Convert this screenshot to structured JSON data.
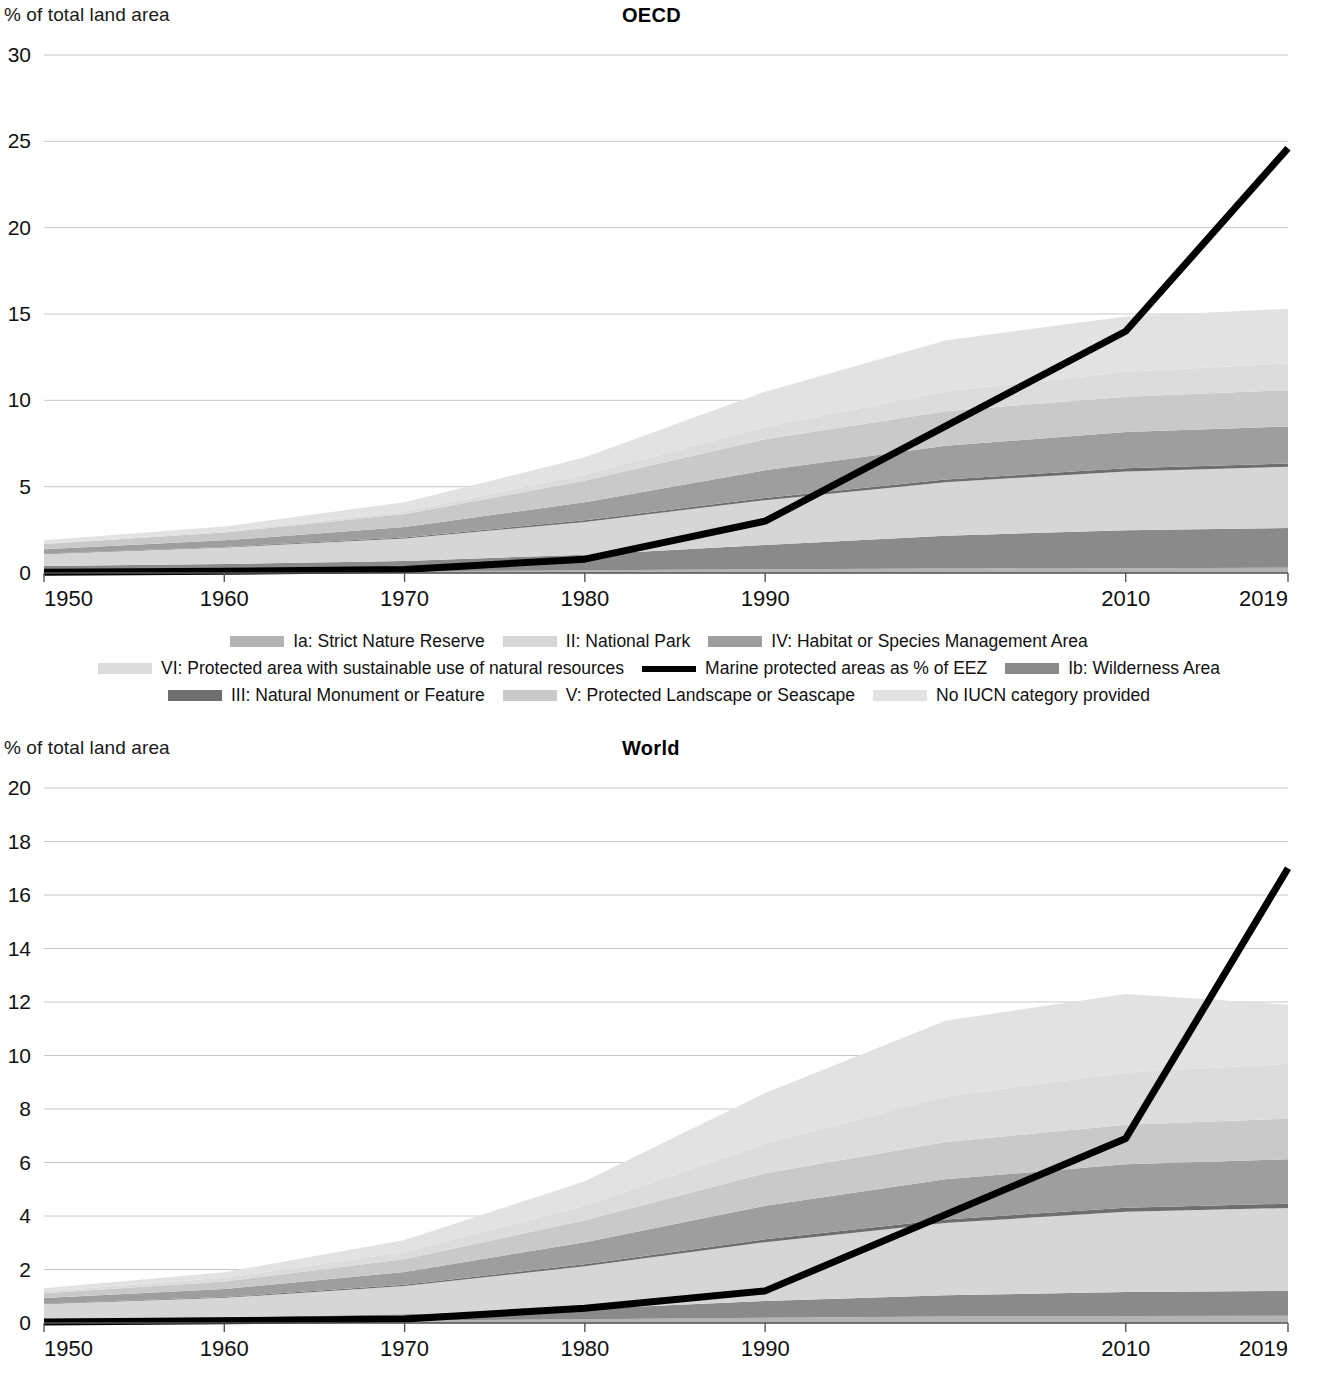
{
  "panels": [
    {
      "id": "oecd",
      "title": "OECD",
      "y_axis_caption": "% of total land area",
      "y_ticks": [
        0,
        5,
        10,
        15,
        20,
        25,
        30
      ],
      "x_ticks": [
        "1950",
        "1960",
        "1970",
        "1980",
        "1990",
        "2010",
        "2019"
      ]
    },
    {
      "id": "world",
      "title": "World",
      "y_axis_caption": "% of total land area",
      "y_ticks": [
        0,
        2,
        4,
        6,
        8,
        10,
        12,
        14,
        16,
        18,
        20
      ],
      "x_ticks": [
        "1950",
        "1960",
        "1970",
        "1980",
        "1990",
        "2010",
        "2019"
      ]
    }
  ],
  "legend": {
    "rows": [
      [
        {
          "label": "Ia: Strict Nature Reserve",
          "swatch": "#b3b3b3",
          "type": "area"
        },
        {
          "label": "II: National Park",
          "swatch": "#d6d6d6",
          "type": "area"
        },
        {
          "label": "IV: Habitat or Species Management Area",
          "swatch": "#9e9e9e",
          "type": "area"
        }
      ],
      [
        {
          "label": "VI: Protected area with sustainable use of natural resources",
          "swatch": "#dcdcdc",
          "type": "area"
        },
        {
          "label": "Marine protected areas as % of EEZ",
          "swatch": "#000000",
          "type": "line"
        },
        {
          "label": "Ib: Wilderness Area",
          "swatch": "#8a8a8a",
          "type": "area"
        }
      ],
      [
        {
          "label": "III: Natural Monument or Feature",
          "swatch": "#6e6e6e",
          "type": "area"
        },
        {
          "label": "V: Protected Landscape or Seascape",
          "swatch": "#c9c9c9",
          "type": "area"
        },
        {
          "label": "No IUCN category provided",
          "swatch": "#e2e2e2",
          "type": "area"
        }
      ]
    ]
  },
  "colors": {
    "marine_line": "#000000",
    "gridline": "#c8c8c8",
    "axis": "#555555",
    "text": "#111111"
  },
  "chart_data": [
    {
      "type": "area",
      "title": "OECD",
      "subtitle": "",
      "xlabel": "",
      "ylabel": "% of total land area",
      "xlim": [
        1950,
        2019
      ],
      "ylim": [
        0,
        30
      ],
      "grid": true,
      "legend_position": "below",
      "x": [
        1950,
        1960,
        1970,
        1980,
        1990,
        2000,
        2010,
        2019
      ],
      "stacked_series": [
        {
          "name": "Ia: Strict Nature Reserve",
          "color": "#b3b3b3",
          "values": [
            0.05,
            0.07,
            0.1,
            0.16,
            0.22,
            0.26,
            0.28,
            0.3
          ]
        },
        {
          "name": "Ib: Wilderness Area",
          "color": "#8a8a8a",
          "values": [
            0.35,
            0.45,
            0.6,
            0.9,
            1.4,
            1.9,
            2.2,
            2.3
          ]
        },
        {
          "name": "II: National Park",
          "color": "#d6d6d6",
          "values": [
            0.7,
            0.95,
            1.3,
            1.9,
            2.6,
            3.1,
            3.4,
            3.55
          ]
        },
        {
          "name": "III: Natural Monument or Feature",
          "color": "#6e6e6e",
          "values": [
            0.03,
            0.04,
            0.06,
            0.09,
            0.13,
            0.16,
            0.18,
            0.19
          ]
        },
        {
          "name": "IV: Habitat or Species Management Area",
          "color": "#9e9e9e",
          "values": [
            0.25,
            0.38,
            0.6,
            1.05,
            1.6,
            1.95,
            2.1,
            2.15
          ]
        },
        {
          "name": "V: Protected Landscape or Seascape",
          "color": "#c9c9c9",
          "values": [
            0.3,
            0.45,
            0.75,
            1.25,
            1.8,
            2.0,
            2.05,
            2.1
          ]
        },
        {
          "name": "VI: Protected area with sustainable use of natural resources",
          "color": "#dcdcdc",
          "values": [
            0.05,
            0.08,
            0.15,
            0.35,
            0.7,
            1.15,
            1.45,
            1.55
          ]
        },
        {
          "name": "No IUCN category provided",
          "color": "#e2e2e2",
          "values": [
            0.17,
            0.28,
            0.54,
            1.0,
            2.05,
            2.95,
            3.2,
            3.16
          ]
        }
      ],
      "line_series": {
        "name": "Marine protected areas as % of EEZ",
        "color": "#000000",
        "x": [
          1950,
          1960,
          1970,
          1980,
          1990,
          2010,
          2019
        ],
        "values": [
          0.05,
          0.1,
          0.2,
          0.8,
          3.0,
          14.0,
          24.6
        ]
      }
    },
    {
      "type": "area",
      "title": "World",
      "subtitle": "",
      "xlabel": "",
      "ylabel": "% of total land area",
      "xlim": [
        1950,
        2019
      ],
      "ylim": [
        0,
        20
      ],
      "grid": true,
      "legend_position": "below",
      "x": [
        1950,
        1960,
        1970,
        1980,
        1990,
        2000,
        2010,
        2019
      ],
      "stacked_series": [
        {
          "name": "Ia: Strict Nature Reserve",
          "color": "#b3b3b3",
          "values": [
            0.04,
            0.06,
            0.09,
            0.14,
            0.2,
            0.24,
            0.26,
            0.27
          ]
        },
        {
          "name": "Ib: Wilderness Area",
          "color": "#8a8a8a",
          "values": [
            0.12,
            0.16,
            0.24,
            0.38,
            0.62,
            0.8,
            0.9,
            0.93
          ]
        },
        {
          "name": "II: National Park",
          "color": "#d6d6d6",
          "values": [
            0.55,
            0.72,
            1.05,
            1.6,
            2.2,
            2.7,
            3.0,
            3.1
          ]
        },
        {
          "name": "III: Natural Monument or Feature",
          "color": "#6e6e6e",
          "values": [
            0.02,
            0.03,
            0.05,
            0.08,
            0.11,
            0.13,
            0.15,
            0.16
          ]
        },
        {
          "name": "IV: Habitat or Species Management Area",
          "color": "#9e9e9e",
          "values": [
            0.2,
            0.3,
            0.48,
            0.82,
            1.25,
            1.5,
            1.62,
            1.66
          ]
        },
        {
          "name": "V: Protected Landscape or Seascape",
          "color": "#c9c9c9",
          "values": [
            0.18,
            0.28,
            0.48,
            0.82,
            1.22,
            1.4,
            1.48,
            1.52
          ]
        },
        {
          "name": "VI: Protected area with sustainable use of natural resources",
          "color": "#dcdcdc",
          "values": [
            0.08,
            0.14,
            0.26,
            0.55,
            1.1,
            1.7,
            1.95,
            2.05
          ]
        },
        {
          "name": "No IUCN category provided",
          "color": "#e2e2e2",
          "values": [
            0.11,
            0.21,
            0.45,
            0.91,
            1.9,
            2.83,
            2.94,
            2.21
          ]
        }
      ],
      "line_series": {
        "name": "Marine protected areas as % of EEZ",
        "color": "#000000",
        "x": [
          1950,
          1960,
          1970,
          1980,
          1990,
          2010,
          2019
        ],
        "values": [
          0.04,
          0.08,
          0.15,
          0.55,
          1.2,
          6.9,
          17.0
        ]
      }
    }
  ]
}
